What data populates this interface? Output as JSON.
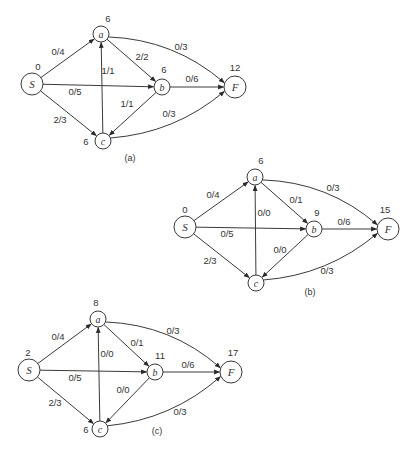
{
  "diagrams": [
    {
      "id": "a",
      "caption": "(a)",
      "caption_pos": [
        130,
        161
      ],
      "nodes": {
        "S": {
          "x": 32,
          "y": 84,
          "r": 11,
          "label": "S",
          "value": "0",
          "value_pos": [
            38,
            70
          ]
        },
        "a": {
          "x": 101,
          "y": 34,
          "r": 8,
          "label": "a",
          "value": "6",
          "value_pos": [
            108,
            22
          ]
        },
        "b": {
          "x": 162,
          "y": 87,
          "r": 8,
          "label": "b",
          "value": "6",
          "value_pos": [
            164,
            73
          ]
        },
        "c": {
          "x": 103,
          "y": 141,
          "r": 8,
          "label": "c",
          "value": "6",
          "value_pos": [
            86,
            145
          ]
        },
        "F": {
          "x": 235,
          "y": 87,
          "r": 11,
          "label": "F",
          "value": "12",
          "value_pos": [
            235,
            71
          ]
        }
      },
      "edges": [
        {
          "from": "S",
          "to": "a",
          "label": "0/4",
          "label_pos": [
            58,
            55
          ]
        },
        {
          "from": "S",
          "to": "b",
          "label": "0/5",
          "label_pos": [
            75,
            95
          ]
        },
        {
          "from": "S",
          "to": "c",
          "label": "2/3",
          "label_pos": [
            60,
            123
          ]
        },
        {
          "from": "a",
          "to": "b",
          "label": "2/2",
          "label_pos": [
            142,
            60
          ]
        },
        {
          "from": "a",
          "to": "F",
          "label": "0/3",
          "label_pos": [
            181,
            50
          ],
          "curve": -22
        },
        {
          "from": "c",
          "to": "a",
          "label": "1/1",
          "label_pos": [
            108,
            74
          ]
        },
        {
          "from": "b",
          "to": "c",
          "label": "1/1",
          "label_pos": [
            127,
            107
          ]
        },
        {
          "from": "b",
          "to": "F",
          "label": "0/6",
          "label_pos": [
            192,
            82
          ]
        },
        {
          "from": "c",
          "to": "F",
          "label": "0/3",
          "label_pos": [
            169,
            117
          ],
          "curve": 20
        }
      ]
    },
    {
      "id": "b",
      "caption": "(b)",
      "caption_pos": [
        310,
        295
      ],
      "nodes": {
        "S": {
          "x": 185,
          "y": 227,
          "r": 11,
          "label": "S",
          "value": "0",
          "value_pos": [
            185,
            213
          ]
        },
        "a": {
          "x": 255,
          "y": 177,
          "r": 8,
          "label": "a",
          "value": "6",
          "value_pos": [
            261,
            164
          ]
        },
        "b": {
          "x": 314,
          "y": 229,
          "r": 8,
          "label": "b",
          "value": "9",
          "value_pos": [
            317,
            216
          ]
        },
        "c": {
          "x": 256,
          "y": 283,
          "r": 8,
          "label": "c",
          "value": "",
          "value_pos": [
            240,
            287
          ]
        },
        "F": {
          "x": 388,
          "y": 229,
          "r": 11,
          "label": "F",
          "value": "15",
          "value_pos": [
            385,
            213
          ]
        }
      },
      "edges": [
        {
          "from": "S",
          "to": "a",
          "label": "0/4",
          "label_pos": [
            213,
            198
          ]
        },
        {
          "from": "S",
          "to": "b",
          "label": "0/5",
          "label_pos": [
            227,
            237
          ]
        },
        {
          "from": "S",
          "to": "c",
          "label": "2/3",
          "label_pos": [
            210,
            264
          ]
        },
        {
          "from": "a",
          "to": "b",
          "label": "0/1",
          "label_pos": [
            296,
            203
          ]
        },
        {
          "from": "a",
          "to": "F",
          "label": "0/3",
          "label_pos": [
            333,
            191
          ],
          "curve": -22
        },
        {
          "from": "c",
          "to": "a",
          "label": "0/0",
          "label_pos": [
            264,
            216
          ]
        },
        {
          "from": "b",
          "to": "c",
          "label": "0/0",
          "label_pos": [
            280,
            253
          ]
        },
        {
          "from": "b",
          "to": "F",
          "label": "0/6",
          "label_pos": [
            344,
            225
          ]
        },
        {
          "from": "c",
          "to": "F",
          "label": "0/3",
          "label_pos": [
            327,
            274
          ],
          "curve": 20
        }
      ]
    },
    {
      "id": "c",
      "caption": "(c)",
      "caption_pos": [
        157,
        434
      ],
      "nodes": {
        "S": {
          "x": 29,
          "y": 370,
          "r": 11,
          "label": "S",
          "value": "2",
          "value_pos": [
            28,
            356
          ]
        },
        "a": {
          "x": 98,
          "y": 319,
          "r": 8,
          "label": "a",
          "value": "8",
          "value_pos": [
            96,
            306
          ]
        },
        "b": {
          "x": 155,
          "y": 372,
          "r": 8,
          "label": "b",
          "value": "11",
          "value_pos": [
            160,
            359
          ]
        },
        "c": {
          "x": 100,
          "y": 429,
          "r": 8,
          "label": "c",
          "value": "6",
          "value_pos": [
            86,
            433
          ]
        },
        "F": {
          "x": 231,
          "y": 372,
          "r": 11,
          "label": "F",
          "value": "17",
          "value_pos": [
            233,
            356
          ]
        }
      },
      "edges": [
        {
          "from": "S",
          "to": "a",
          "label": "0/4",
          "label_pos": [
            58,
            340
          ]
        },
        {
          "from": "S",
          "to": "b",
          "label": "0/5",
          "label_pos": [
            75,
            381
          ]
        },
        {
          "from": "S",
          "to": "c",
          "label": "2/3",
          "label_pos": [
            55,
            406
          ]
        },
        {
          "from": "a",
          "to": "b",
          "label": "0/1",
          "label_pos": [
            137,
            346
          ]
        },
        {
          "from": "a",
          "to": "F",
          "label": "0/3",
          "label_pos": [
            173,
            334
          ],
          "curve": -22
        },
        {
          "from": "c",
          "to": "a",
          "label": "0/0",
          "label_pos": [
            107,
            357
          ]
        },
        {
          "from": "b",
          "to": "c",
          "label": "0/0",
          "label_pos": [
            123,
            393
          ]
        },
        {
          "from": "b",
          "to": "F",
          "label": "0/6",
          "label_pos": [
            188,
            368
          ]
        },
        {
          "from": "c",
          "to": "F",
          "label": "0/3",
          "label_pos": [
            180,
            415
          ],
          "curve": 20
        }
      ]
    }
  ]
}
